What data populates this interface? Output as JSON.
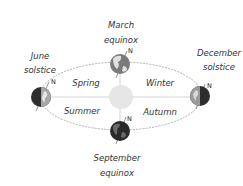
{
  "diagram": {
    "type": "earth-orbit-seasons",
    "positions": [
      {
        "id": "march",
        "label_line1": "March",
        "label_line2": "equinox",
        "north": "N"
      },
      {
        "id": "june",
        "label_line1": "June",
        "label_line2": "solstice",
        "north": "N"
      },
      {
        "id": "december",
        "label_line1": "December",
        "label_line2": "solstice",
        "north": "N"
      },
      {
        "id": "september",
        "label_line1": "September",
        "label_line2": "equinox",
        "north": "N"
      }
    ],
    "seasons": {
      "spring": "Spring",
      "winter": "Winter",
      "summer": "Summer",
      "autumn": "Autumn"
    },
    "colors": {
      "orbit": "#999999",
      "sun": "#e6e6e6",
      "earth_dark": "#333333",
      "earth_land": "#8c8c8c",
      "earth_light": "#c8c8c8"
    }
  }
}
